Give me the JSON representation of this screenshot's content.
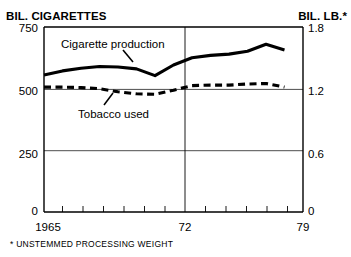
{
  "axes": {
    "left_title": "BIL. CIGARETTES",
    "right_title": "BIL. LB.*",
    "left_ticks": [
      "750",
      "500",
      "250",
      "0"
    ],
    "right_ticks": [
      "1.8",
      "1.2",
      "0.6",
      "0"
    ],
    "x_ticks": [
      "1965",
      "72",
      "79"
    ]
  },
  "series_labels": {
    "cigarette": "Cigarette production",
    "tobacco": "Tobacco used"
  },
  "footnote": "* UNSTEMMED PROCESSING WEIGHT",
  "chart_data": {
    "type": "line",
    "title": "",
    "xlabel": "",
    "ylabel": "BIL. CIGARETTES",
    "y2label": "BIL. LB.*",
    "xlim": [
      1965,
      1979
    ],
    "ylim": [
      0,
      750
    ],
    "y2lim": [
      0,
      1.8
    ],
    "grid": true,
    "gridlines_y": [
      250,
      500,
      750
    ],
    "gridline_x": [
      1972
    ],
    "legend": "inline-annotations",
    "x": [
      1965,
      1966,
      1967,
      1968,
      1969,
      1970,
      1971,
      1972,
      1973,
      1974,
      1975,
      1976,
      1977,
      1978
    ],
    "series": [
      {
        "name": "Cigarette production",
        "axis": "left",
        "style": "solid",
        "units": "billion cigarettes",
        "values": [
          555,
          572,
          583,
          590,
          588,
          580,
          553,
          596,
          625,
          635,
          640,
          652,
          680,
          657
        ]
      },
      {
        "name": "Tobacco used",
        "axis": "right",
        "style": "dashed",
        "units": "billion lb.",
        "values": [
          1.215,
          1.215,
          1.21,
          1.2,
          1.17,
          1.15,
          1.145,
          1.185,
          1.23,
          1.235,
          1.235,
          1.245,
          1.25,
          1.215
        ]
      }
    ]
  }
}
